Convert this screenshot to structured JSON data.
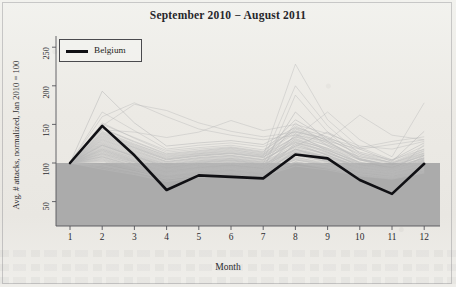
{
  "figure": {
    "title": "September 2010 − August 2011",
    "xlabel": "Month",
    "ylabel": "Avg. # attacks, normalized, Jan 2010 = 100",
    "legend_label": "Belgium",
    "highlight_color": "#101014",
    "background_color": "#efefeb",
    "band_color": "#a8a8a8",
    "series_color": "#b9b9b9"
  },
  "chart_data": {
    "type": "line",
    "title": "September 2010 − August 2011",
    "xlabel": "Month",
    "ylabel": "Avg. # attacks, normalized, Jan 2010 = 100",
    "x": [
      1,
      2,
      3,
      4,
      5,
      6,
      7,
      8,
      9,
      10,
      11,
      12
    ],
    "xtick_labels": [
      "1",
      "2",
      "3",
      "4",
      "5",
      "6",
      "7",
      "8",
      "9",
      "10",
      "11",
      "12"
    ],
    "ytick_labels": [
      "50",
      "100",
      "150",
      "200",
      "250"
    ],
    "yticks": [
      50,
      100,
      150,
      200,
      250
    ],
    "xlim": [
      0.6,
      12.4
    ],
    "ylim": [
      17,
      268
    ],
    "grid": false,
    "legend_position": "top-left",
    "legend_entries": [
      "Belgium"
    ],
    "shaded_band": {
      "from": 17,
      "to": 100,
      "color": "#a8a8a8"
    },
    "highlight_series": {
      "name": "Belgium",
      "values": [
        100,
        148,
        110,
        65,
        84,
        82,
        80,
        111,
        106,
        78,
        60,
        99
      ]
    },
    "background_series": [
      {
        "name": "series-01",
        "values": [
          100,
          123,
          108,
          95,
          100,
          103,
          98,
          118,
          108,
          96,
          92,
          104
        ]
      },
      {
        "name": "series-02",
        "values": [
          100,
          131,
          116,
          102,
          107,
          110,
          104,
          126,
          116,
          101,
          96,
          110
        ]
      },
      {
        "name": "series-03",
        "values": [
          100,
          118,
          104,
          90,
          96,
          99,
          94,
          112,
          104,
          92,
          88,
          99
        ]
      },
      {
        "name": "series-04",
        "values": [
          100,
          140,
          124,
          110,
          114,
          118,
          111,
          134,
          123,
          108,
          101,
          118
        ]
      },
      {
        "name": "series-05",
        "values": [
          100,
          112,
          100,
          87,
          92,
          95,
          91,
          107,
          100,
          89,
          85,
          95
        ]
      },
      {
        "name": "series-06",
        "values": [
          100,
          193,
          152,
          122,
          126,
          129,
          124,
          146,
          134,
          114,
          104,
          126
        ]
      },
      {
        "name": "series-07",
        "values": [
          100,
          166,
          142,
          118,
          123,
          126,
          121,
          141,
          130,
          112,
          103,
          122
        ]
      },
      {
        "name": "series-08",
        "values": [
          100,
          108,
          97,
          85,
          90,
          93,
          89,
          104,
          98,
          88,
          84,
          93
        ]
      },
      {
        "name": "series-09",
        "values": [
          100,
          127,
          112,
          98,
          103,
          106,
          101,
          121,
          112,
          99,
          93,
          107
        ]
      },
      {
        "name": "series-10",
        "values": [
          100,
          135,
          120,
          105,
          110,
          113,
          108,
          129,
          119,
          104,
          98,
          113
        ]
      },
      {
        "name": "series-11",
        "values": [
          100,
          104,
          94,
          83,
          88,
          91,
          87,
          101,
          95,
          86,
          82,
          91
        ]
      },
      {
        "name": "series-12",
        "values": [
          100,
          121,
          107,
          94,
          99,
          102,
          97,
          116,
          107,
          95,
          90,
          102
        ]
      },
      {
        "name": "series-13",
        "values": [
          100,
          148,
          176,
          168,
          152,
          141,
          134,
          140,
          132,
          120,
          128,
          134
        ]
      },
      {
        "name": "series-14",
        "values": [
          100,
          160,
          178,
          160,
          144,
          136,
          130,
          136,
          128,
          118,
          124,
          130
        ]
      },
      {
        "name": "series-15",
        "values": [
          100,
          143,
          140,
          133,
          140,
          155,
          142,
          150,
          138,
          122,
          118,
          128
        ]
      },
      {
        "name": "series-16",
        "values": [
          100,
          96,
          88,
          79,
          84,
          87,
          83,
          96,
          91,
          83,
          79,
          87
        ]
      },
      {
        "name": "series-17",
        "values": [
          100,
          115,
          102,
          89,
          94,
          97,
          93,
          110,
          102,
          91,
          87,
          97
        ]
      },
      {
        "name": "series-18",
        "values": [
          100,
          137,
          121,
          106,
          111,
          114,
          109,
          228,
          156,
          120,
          104,
          118
        ]
      },
      {
        "name": "series-19",
        "values": [
          100,
          129,
          114,
          100,
          105,
          108,
          103,
          200,
          148,
          112,
          100,
          113
        ]
      },
      {
        "name": "series-20",
        "values": [
          100,
          110,
          99,
          86,
          91,
          94,
          90,
          188,
          140,
          106,
          96,
          106
        ]
      },
      {
        "name": "series-21",
        "values": [
          100,
          125,
          110,
          97,
          102,
          105,
          100,
          166,
          128,
          104,
          94,
          105
        ]
      },
      {
        "name": "series-22",
        "values": [
          100,
          119,
          106,
          93,
          98,
          101,
          96,
          152,
          122,
          100,
          92,
          101
        ]
      },
      {
        "name": "series-23",
        "values": [
          100,
          106,
          95,
          84,
          89,
          92,
          88,
          138,
          115,
          96,
          88,
          97
        ]
      },
      {
        "name": "series-24",
        "values": [
          100,
          133,
          118,
          104,
          109,
          112,
          107,
          144,
          126,
          105,
          96,
          109
        ]
      },
      {
        "name": "series-25",
        "values": [
          100,
          102,
          92,
          81,
          86,
          89,
          86,
          126,
          110,
          93,
          86,
          94
        ]
      },
      {
        "name": "series-26",
        "values": [
          100,
          145,
          128,
          112,
          116,
          120,
          114,
          156,
          132,
          110,
          100,
          116
        ]
      },
      {
        "name": "series-27",
        "values": [
          100,
          98,
          89,
          80,
          85,
          88,
          84,
          118,
          104,
          90,
          84,
          91
        ]
      },
      {
        "name": "series-28",
        "values": [
          100,
          116,
          103,
          91,
          96,
          99,
          95,
          130,
          114,
          97,
          90,
          100
        ]
      },
      {
        "name": "series-29",
        "values": [
          100,
          124,
          109,
          96,
          101,
          104,
          99,
          136,
          118,
          99,
          91,
          103
        ]
      },
      {
        "name": "series-30",
        "values": [
          100,
          113,
          101,
          89,
          93,
          96,
          92,
          124,
          110,
          94,
          88,
          98
        ]
      },
      {
        "name": "series-31",
        "values": [
          100,
          108,
          96,
          85,
          90,
          93,
          89,
          114,
          103,
          90,
          85,
          94
        ]
      },
      {
        "name": "series-32",
        "values": [
          100,
          139,
          122,
          107,
          112,
          115,
          110,
          148,
          128,
          106,
          97,
          112
        ]
      },
      {
        "name": "series-33",
        "values": [
          100,
          94,
          86,
          77,
          82,
          86,
          82,
          108,
          98,
          86,
          81,
          89
        ]
      },
      {
        "name": "series-34",
        "values": [
          100,
          128,
          113,
          99,
          104,
          107,
          102,
          132,
          117,
          98,
          91,
          104
        ]
      },
      {
        "name": "series-35",
        "values": [
          100,
          120,
          106,
          93,
          98,
          101,
          97,
          122,
          110,
          95,
          89,
          100
        ]
      },
      {
        "name": "series-36",
        "values": [
          100,
          111,
          99,
          87,
          92,
          95,
          91,
          112,
          102,
          89,
          84,
          94
        ]
      },
      {
        "name": "series-37",
        "values": [
          100,
          150,
          133,
          116,
          120,
          123,
          117,
          142,
          126,
          108,
          99,
          115
        ]
      },
      {
        "name": "series-38",
        "values": [
          100,
          103,
          93,
          82,
          87,
          90,
          87,
          104,
          96,
          86,
          82,
          91
        ]
      },
      {
        "name": "series-39",
        "values": [
          100,
          132,
          117,
          102,
          107,
          110,
          105,
          128,
          114,
          97,
          90,
          103
        ]
      },
      {
        "name": "series-40",
        "values": [
          100,
          117,
          104,
          92,
          97,
          100,
          96,
          117,
          106,
          92,
          87,
          98
        ]
      },
      {
        "name": "series-41",
        "values": [
          100,
          92,
          85,
          76,
          81,
          85,
          81,
          100,
          93,
          84,
          80,
          88
        ]
      },
      {
        "name": "series-42",
        "values": [
          100,
          141,
          125,
          109,
          113,
          117,
          112,
          138,
          122,
          104,
          95,
          110
        ]
      },
      {
        "name": "series-43",
        "values": [
          100,
          122,
          108,
          95,
          100,
          103,
          98,
          120,
          108,
          93,
          88,
          99
        ]
      },
      {
        "name": "series-44",
        "values": [
          100,
          107,
          96,
          85,
          90,
          93,
          89,
          106,
          98,
          87,
          83,
          92
        ]
      },
      {
        "name": "series-45",
        "values": [
          100,
          136,
          120,
          105,
          110,
          113,
          108,
          134,
          119,
          101,
          93,
          107
        ]
      },
      {
        "name": "series-46",
        "values": [
          100,
          114,
          102,
          90,
          95,
          98,
          94,
          114,
          104,
          91,
          86,
          96
        ]
      },
      {
        "name": "series-47",
        "values": [
          100,
          126,
          111,
          98,
          103,
          106,
          101,
          124,
          111,
          95,
          89,
          101
        ]
      },
      {
        "name": "series-48",
        "values": [
          100,
          100,
          91,
          81,
          86,
          89,
          85,
          102,
          95,
          85,
          81,
          90
        ]
      },
      {
        "name": "series-49",
        "values": [
          100,
          144,
          127,
          111,
          115,
          119,
          113,
          140,
          124,
          105,
          96,
          111
        ]
      },
      {
        "name": "series-50",
        "values": [
          100,
          109,
          98,
          86,
          91,
          94,
          90,
          110,
          101,
          88,
          84,
          93
        ]
      },
      {
        "name": "series-51",
        "values": [
          100,
          130,
          115,
          101,
          106,
          109,
          104,
          127,
          113,
          96,
          90,
          102
        ]
      },
      {
        "name": "series-52",
        "values": [
          100,
          118,
          105,
          92,
          97,
          100,
          96,
          118,
          107,
          93,
          88,
          98
        ]
      },
      {
        "name": "series-53",
        "values": [
          100,
          97,
          89,
          79,
          84,
          88,
          84,
          101,
          94,
          84,
          80,
          89
        ]
      },
      {
        "name": "series-54",
        "values": [
          100,
          152,
          132,
          114,
          118,
          121,
          115,
          145,
          129,
          162,
          136,
          130
        ]
      },
      {
        "name": "series-55",
        "values": [
          100,
          138,
          123,
          108,
          112,
          116,
          110,
          133,
          166,
          130,
          108,
          178
        ]
      },
      {
        "name": "series-56",
        "values": [
          100,
          123,
          109,
          96,
          101,
          104,
          99,
          122,
          140,
          118,
          102,
          141
        ]
      },
      {
        "name": "series-57",
        "values": [
          100,
          112,
          101,
          88,
          93,
          96,
          92,
          113,
          105,
          90,
          85,
          124
        ]
      },
      {
        "name": "series-58",
        "values": [
          100,
          105,
          95,
          84,
          89,
          92,
          88,
          105,
          97,
          86,
          82,
          110
        ]
      },
      {
        "name": "series-59",
        "values": [
          100,
          134,
          119,
          104,
          109,
          112,
          107,
          131,
          117,
          100,
          92,
          106
        ]
      },
      {
        "name": "series-60",
        "values": [
          100,
          116,
          103,
          91,
          96,
          99,
          95,
          115,
          105,
          92,
          87,
          97
        ]
      }
    ]
  }
}
